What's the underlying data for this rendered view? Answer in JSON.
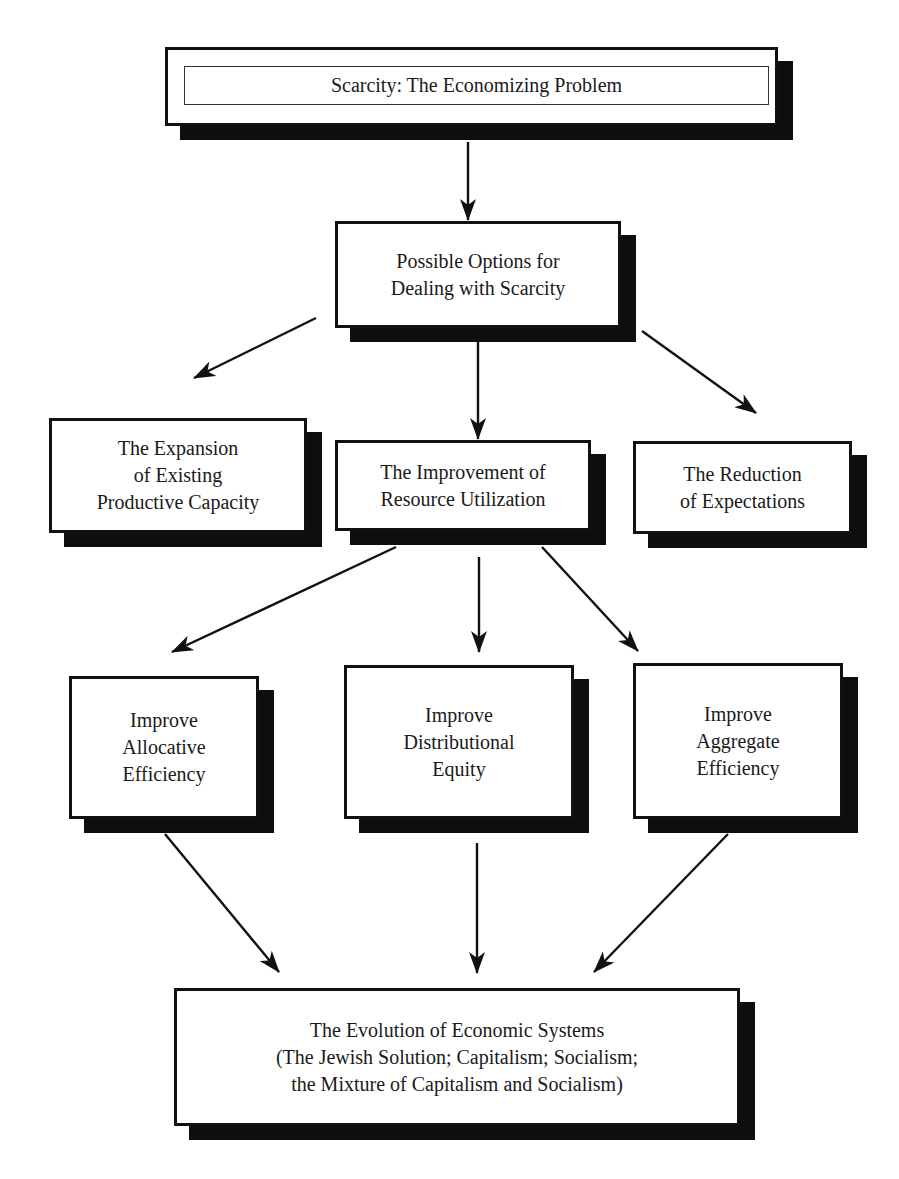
{
  "diagram": {
    "type": "flowchart",
    "nodes": {
      "scarcity": {
        "label": "Scarcity:  The Economizing Problem"
      },
      "options": {
        "label": "Possible Options for\nDealing with Scarcity"
      },
      "expansion": {
        "label": "The Expansion\nof Existing\nProductive Capacity"
      },
      "improvement": {
        "label": "The Improvement of\nResource Utilization"
      },
      "reduction": {
        "label": "The Reduction\nof Expectations"
      },
      "allocative": {
        "label": "Improve\nAllocative\nEfficiency"
      },
      "distributional": {
        "label": "Improve\nDistributional\nEquity"
      },
      "aggregate": {
        "label": "Improve\nAggregate\nEfficiency"
      },
      "evolution": {
        "label": "The Evolution of Economic Systems\n(The Jewish Solution; Capitalism; Socialism;\nthe Mixture of Capitalism and Socialism)"
      }
    },
    "edges": [
      {
        "from": "scarcity",
        "to": "options"
      },
      {
        "from": "options",
        "to": "expansion"
      },
      {
        "from": "options",
        "to": "improvement"
      },
      {
        "from": "options",
        "to": "reduction"
      },
      {
        "from": "improvement",
        "to": "allocative"
      },
      {
        "from": "improvement",
        "to": "distributional"
      },
      {
        "from": "improvement",
        "to": "aggregate"
      },
      {
        "from": "allocative",
        "to": "evolution"
      },
      {
        "from": "distributional",
        "to": "evolution"
      },
      {
        "from": "aggregate",
        "to": "evolution"
      }
    ],
    "colors": {
      "box_border": "#111111",
      "box_fill": "#ffffff",
      "shadow": "#0e0e0e",
      "arrow": "#111111"
    }
  }
}
